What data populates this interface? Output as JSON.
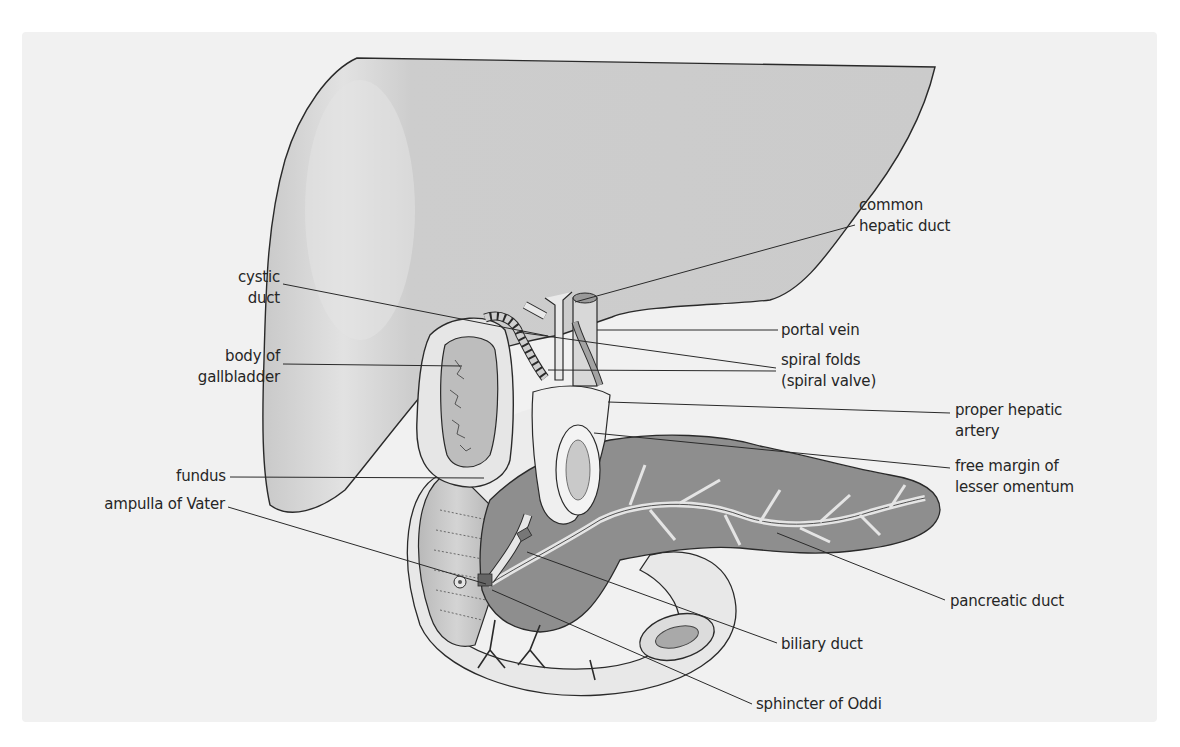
{
  "figure": {
    "colors": {
      "panel": "#f1f1f1",
      "liver": "#cfcfcf",
      "liver_highlight": "#e4e4e4",
      "gallbladder_wall": "#e6e6e6",
      "gallbladder_lumen": "#bdbdbd",
      "pancreas": "#8e8e8e",
      "duodenum": "#c4c4c4",
      "stomach_peritoneum": "#ebebeb",
      "duct": "#e9e9e9",
      "outline": "#2a2a2a",
      "label_text": "#262626"
    }
  },
  "labels": {
    "common_hepatic_duct": {
      "lines": [
        "common",
        "hepatic duct"
      ]
    },
    "cystic_duct": {
      "lines": [
        "cystic",
        "duct"
      ]
    },
    "portal_vein": {
      "lines": [
        "portal vein"
      ]
    },
    "body_of_gallbladder": {
      "lines": [
        "body of",
        "gallbladder"
      ]
    },
    "spiral_folds": {
      "lines": [
        "spiral folds",
        "(spiral valve)"
      ]
    },
    "proper_hepatic_artery": {
      "lines": [
        "proper hepatic",
        "artery"
      ]
    },
    "fundus": {
      "lines": [
        "fundus"
      ]
    },
    "free_margin": {
      "lines": [
        "free margin of",
        "lesser omentum"
      ]
    },
    "ampulla_of_vater": {
      "lines": [
        "ampulla of Vater"
      ]
    },
    "pancreatic_duct": {
      "lines": [
        "pancreatic duct"
      ]
    },
    "biliary_duct": {
      "lines": [
        "biliary duct"
      ]
    },
    "sphincter_of_oddi": {
      "lines": [
        "sphincter of Oddi"
      ]
    }
  }
}
